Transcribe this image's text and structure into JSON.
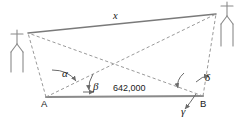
{
  "figure": {
    "type": "surveying-triangulation-diagram",
    "background_color": "#ffffff",
    "solid_line_color": "#7a7a7a",
    "dashed_line_color": "#9a9a9a",
    "label_color": "#1a1a1a",
    "labels": {
      "unknown_distance": "x",
      "baseline_distance": "642,000",
      "point_a": "A",
      "point_b": "B",
      "angle_alpha": "α",
      "angle_beta": "β",
      "angle_gamma": "γ",
      "angle_delta": "δ"
    },
    "icons": {
      "left_landmark": "church-icon",
      "right_landmark": "church-icon"
    },
    "geometry": {
      "point_a": [
        46,
        97
      ],
      "point_b": [
        203,
        96
      ],
      "left_church_vertex": [
        28,
        33
      ],
      "right_church_vertex": [
        216,
        14
      ],
      "diagonal_crossing": [
        113,
        62
      ]
    }
  }
}
